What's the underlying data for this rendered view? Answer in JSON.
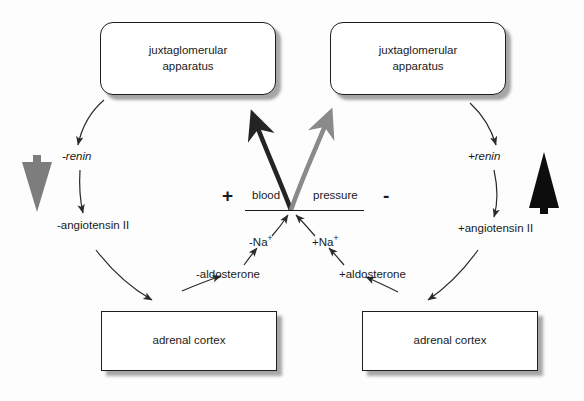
{
  "diagram": {
    "nodes": {
      "jga_left": "juxtaglomerular\napparatus",
      "jga_left_line1": "juxtaglomerular",
      "jga_left_line2": "apparatus",
      "jga_right_line1": "juxtaglomerular",
      "jga_right_line2": "apparatus",
      "adrenal_left": "adrenal cortex",
      "adrenal_right": "adrenal cortex"
    },
    "center": {
      "plus_sign": "+",
      "minus_sign": "-",
      "blood_word": "blood",
      "pressure_word": "pressure"
    },
    "left_branch": {
      "renin": "-renin",
      "angiotensin": "-angiotensin II",
      "aldosterone": "-aldosterone",
      "sodium": "-Na",
      "sodium_sup": "+"
    },
    "right_branch": {
      "renin": "+renin",
      "angiotensin": "+angiotensin II",
      "aldosterone": "+aldosterone",
      "sodium": "+Na",
      "sodium_sup": "+"
    },
    "indicators": {
      "left_arrow_name": "down-arrow-gray",
      "left_arrow_color": "#7d7d7d",
      "right_arrow_name": "up-arrow-black",
      "right_arrow_color": "#0d0d0d"
    },
    "colors": {
      "stroke": "#2a2a2a",
      "thick_left": "#242424",
      "thick_right": "#8a8a8a",
      "box_border": "#1d1d1d",
      "background": "#fdfdfd"
    }
  }
}
